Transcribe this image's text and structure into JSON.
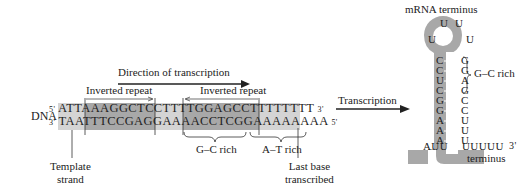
{
  "direction_label": "Direction of transcription",
  "inverted_repeat_left": "Inverted repeat",
  "inverted_repeat_right": "Inverted repeat",
  "dna_label": "DNA",
  "top_strand": {
    "five_prime": "5'",
    "segments": [
      "ATT",
      "AAAGGCTCC",
      "TTTT",
      "GGAGCCTTT",
      "TTTTT"
    ],
    "three_prime": "3'"
  },
  "bottom_strand": {
    "three_prime": "3'",
    "segments": [
      "TAA",
      "TTTCCGAGG",
      "AAAA",
      "CCTCGGAAA",
      "AAAAA"
    ],
    "five_prime": "5'"
  },
  "gc_rich_label": "G–C rich",
  "at_rich_label": "A–T rich",
  "template_strand_label": [
    "Template",
    "strand"
  ],
  "last_base_label": [
    "Last base",
    "transcribed"
  ],
  "transcription_label": "Transcription",
  "hairpin": {
    "title": "mRNA terminus",
    "loop": [
      "U",
      "U",
      "U",
      "U"
    ],
    "left_stem": [
      "C",
      "C",
      "U",
      "C",
      "G",
      "G",
      "A",
      "A",
      "A"
    ],
    "right_stem": [
      "G",
      "G",
      "A",
      "G",
      "C",
      "C",
      "U",
      "U",
      "U"
    ],
    "left_tail": "AUU",
    "right_tail": "UUUUU",
    "three_prime": "3'",
    "terminus_label": "terminus",
    "gc_rich_label": "G–C rich"
  }
}
